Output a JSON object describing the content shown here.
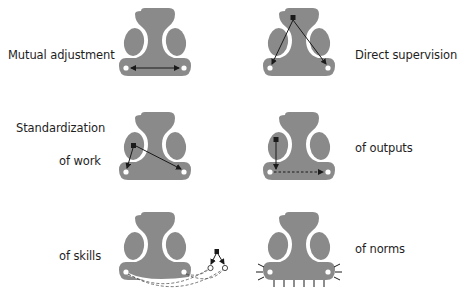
{
  "colors": {
    "shape_fill": "#8a8a8a",
    "outline_gap": "#ffffff",
    "arrow": "#1a1a1a",
    "text": "#1e1e1e"
  },
  "labels": {
    "mutual_adjustment": "Mutual adjustment",
    "direct_supervision": "Direct supervision",
    "standardization": "Standardization",
    "of_work": "of work",
    "of_outputs": "of outputs",
    "of_skills": "of skills",
    "of_norms": "of norms"
  },
  "diagrams": [
    {
      "id": "mutual-adjustment",
      "row": 1,
      "col": 1,
      "connector": "double-headed arrow between two operators"
    },
    {
      "id": "direct-supervision",
      "row": 1,
      "col": 2,
      "connector": "arrows from manager (black square) to two operators"
    },
    {
      "id": "standardization-of-work",
      "row": 2,
      "col": 1,
      "connector": "arrows from technostructure (black square) to operators"
    },
    {
      "id": "standardization-of-outputs",
      "row": 2,
      "col": 2,
      "connector": "arrow from technostructure to dashed line between operators"
    },
    {
      "id": "standardization-of-skills",
      "row": 3,
      "col": 1,
      "connector": "dashed curves from external training node to operators"
    },
    {
      "id": "standardization-of-norms",
      "row": 3,
      "col": 2,
      "connector": "spikes radiating from base of organization"
    }
  ]
}
